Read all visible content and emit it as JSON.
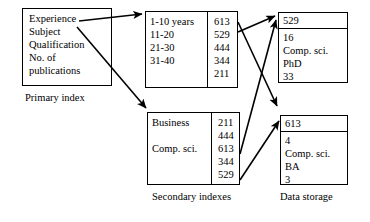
{
  "diagram": {
    "title_hidden": "Indexed database structure diagram",
    "primary_index": {
      "caption": "Primary index",
      "fields": [
        "Experience",
        "Subject",
        "Qualification",
        "No. of",
        "publications"
      ]
    },
    "secondary_indexes": {
      "caption": "Secondary indexes",
      "experience_index": {
        "keys": [
          "1-10 years",
          "11-20",
          "21-30",
          "31-40",
          ""
        ],
        "pointers": [
          "613",
          "529",
          "444",
          "344",
          "211"
        ]
      },
      "subject_index": {
        "keys": [
          "Business",
          "",
          "Comp. sci.",
          "",
          ""
        ],
        "pointers": [
          "211",
          "444",
          "613",
          "344",
          "529"
        ]
      }
    },
    "data_storage": {
      "caption": "Data storage",
      "records": [
        {
          "id": "529",
          "fields": [
            "16",
            "Comp. sci.",
            "PhD",
            "33"
          ]
        },
        {
          "id": "613",
          "fields": [
            "4",
            "Comp. sci.",
            "BA",
            "3"
          ]
        }
      ]
    },
    "arrows": [
      {
        "name": "primary-to-experience-index",
        "from": "Experience",
        "to": "1-10 years index"
      },
      {
        "name": "primary-to-subject-index",
        "from": "Subject",
        "to": "Business index"
      },
      {
        "name": "experience-529-to-record-529",
        "from": "529",
        "to": "529"
      },
      {
        "name": "experience-613-to-record-613",
        "from": "613",
        "to": "613"
      },
      {
        "name": "subject-613-to-record-529",
        "from": "613",
        "to": "529"
      },
      {
        "name": "subject-529-to-record-613",
        "from": "529",
        "to": "613"
      }
    ],
    "stroke_color": "#000000",
    "background_color": "#ffffff"
  }
}
